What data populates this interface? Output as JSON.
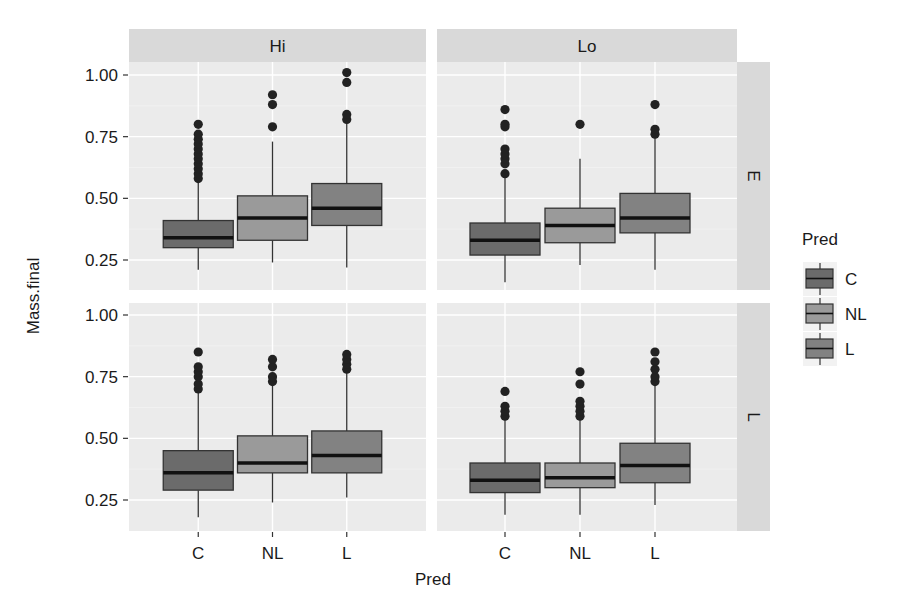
{
  "chart_data": {
    "type": "boxplot",
    "title": "",
    "xlabel": "Pred",
    "ylabel": "Mass.final",
    "ylim": [
      0.14,
      1.04
    ],
    "yticks": [
      0.25,
      0.5,
      0.75,
      1.0
    ],
    "ytick_labels": [
      "0.25",
      "0.50",
      "0.75",
      "1.00"
    ],
    "categories": [
      "C",
      "NL",
      "L"
    ],
    "grid": true,
    "facet_cols": {
      "var": "",
      "levels": [
        "Hi",
        "Lo"
      ]
    },
    "facet_rows": {
      "var": "",
      "levels": [
        "E",
        "L"
      ]
    },
    "legend": {
      "title": "Pred",
      "position": "right",
      "entries": [
        {
          "label": "C",
          "color": "#6b6b6b"
        },
        {
          "label": "NL",
          "color": "#9a9a9a"
        },
        {
          "label": "L",
          "color": "#828282"
        }
      ]
    },
    "panels": [
      {
        "col": "Hi",
        "row": "E",
        "boxes": [
          {
            "category": "C",
            "min": 0.21,
            "q1": 0.3,
            "median": 0.34,
            "q3": 0.41,
            "max": 0.57,
            "outliers": [
              0.58,
              0.6,
              0.62,
              0.64,
              0.66,
              0.68,
              0.7,
              0.72,
              0.74,
              0.76,
              0.8
            ]
          },
          {
            "category": "NL",
            "min": 0.24,
            "q1": 0.33,
            "median": 0.42,
            "q3": 0.51,
            "max": 0.73,
            "outliers": [
              0.79,
              0.88,
              0.92
            ]
          },
          {
            "category": "L",
            "min": 0.22,
            "q1": 0.39,
            "median": 0.46,
            "q3": 0.56,
            "max": 0.81,
            "outliers": [
              0.82,
              0.84,
              0.97,
              1.01
            ]
          }
        ]
      },
      {
        "col": "Lo",
        "row": "E",
        "boxes": [
          {
            "category": "C",
            "min": 0.16,
            "q1": 0.27,
            "median": 0.33,
            "q3": 0.4,
            "max": 0.59,
            "outliers": [
              0.6,
              0.64,
              0.66,
              0.68,
              0.7,
              0.79,
              0.8,
              0.86
            ]
          },
          {
            "category": "NL",
            "min": 0.23,
            "q1": 0.32,
            "median": 0.39,
            "q3": 0.46,
            "max": 0.66,
            "outliers": [
              0.8
            ]
          },
          {
            "category": "L",
            "min": 0.21,
            "q1": 0.36,
            "median": 0.42,
            "q3": 0.52,
            "max": 0.75,
            "outliers": [
              0.76,
              0.78,
              0.88
            ]
          }
        ]
      },
      {
        "col": "Hi",
        "row": "L",
        "boxes": [
          {
            "category": "C",
            "min": 0.18,
            "q1": 0.29,
            "median": 0.36,
            "q3": 0.45,
            "max": 0.69,
            "outliers": [
              0.7,
              0.72,
              0.75,
              0.77,
              0.79,
              0.85
            ]
          },
          {
            "category": "NL",
            "min": 0.24,
            "q1": 0.36,
            "median": 0.4,
            "q3": 0.51,
            "max": 0.72,
            "outliers": [
              0.73,
              0.75,
              0.79,
              0.82
            ]
          },
          {
            "category": "L",
            "min": 0.26,
            "q1": 0.36,
            "median": 0.43,
            "q3": 0.53,
            "max": 0.77,
            "outliers": [
              0.78,
              0.8,
              0.82,
              0.84
            ]
          }
        ]
      },
      {
        "col": "Lo",
        "row": "L",
        "boxes": [
          {
            "category": "C",
            "min": 0.19,
            "q1": 0.28,
            "median": 0.33,
            "q3": 0.4,
            "max": 0.58,
            "outliers": [
              0.59,
              0.61,
              0.63,
              0.69
            ]
          },
          {
            "category": "NL",
            "min": 0.19,
            "q1": 0.3,
            "median": 0.34,
            "q3": 0.4,
            "max": 0.58,
            "outliers": [
              0.59,
              0.61,
              0.63,
              0.65,
              0.72,
              0.77
            ]
          },
          {
            "category": "L",
            "min": 0.23,
            "q1": 0.32,
            "median": 0.39,
            "q3": 0.48,
            "max": 0.72,
            "outliers": [
              0.73,
              0.75,
              0.78,
              0.81,
              0.85
            ]
          }
        ]
      }
    ]
  },
  "style": {
    "panel_bg": "#ebebeb",
    "strip_bg": "#d9d9d9",
    "grid_major": "#ffffff",
    "grid_minor": "#f3f3f3",
    "box_outline": "#333333",
    "median_color": "#111111",
    "outlier_color": "#222222",
    "text_color": "#1a1a1a"
  }
}
